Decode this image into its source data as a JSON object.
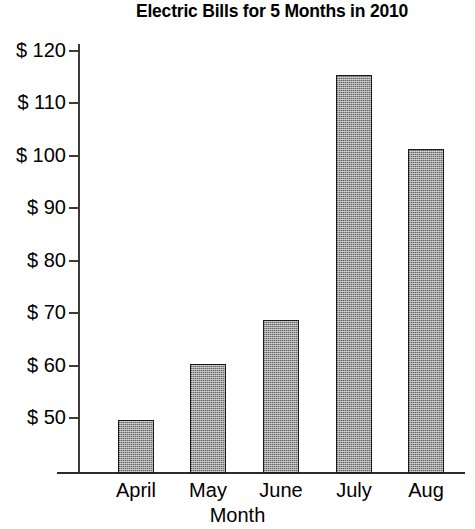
{
  "chart_data": {
    "type": "bar",
    "title": "Electric Bills for 5 Months in 2010",
    "xlabel": "Month",
    "ylabel": "",
    "categories": [
      "April",
      "May",
      "June",
      "July",
      "Aug"
    ],
    "values": [
      49.7,
      60.3,
      68.7,
      115.3,
      101.3
    ],
    "series": [
      {
        "name": "Electric Bill",
        "values": [
          49.7,
          60.3,
          68.7,
          115.3,
          101.3
        ]
      }
    ],
    "ytick_labels": [
      "$ 120",
      "$ 110",
      "$ 100",
      "$ 90",
      "$ 80",
      "$ 70",
      "$ 60",
      "$ 50"
    ],
    "ytick_values": [
      120,
      110,
      100,
      90,
      80,
      70,
      60,
      50
    ],
    "ylim": [
      38.5,
      120
    ],
    "grid": false,
    "legend": false,
    "bar_fill": "#9a9a9a",
    "bar_outline": "#1a1a1a",
    "axis_color": "#2b2b2b"
  }
}
